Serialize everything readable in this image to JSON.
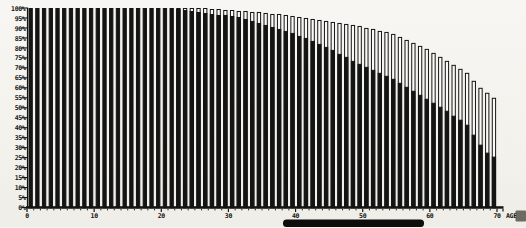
{
  "page": {
    "background": "#f3f1ec",
    "ink": "#141413",
    "paper_white": "#fbfaf6"
  },
  "chart_data": {
    "type": "bar",
    "title": "",
    "subtitle": "",
    "xlabel": "AGE",
    "ylabel": "",
    "xlim": [
      0,
      70
    ],
    "ylim": [
      0,
      100
    ],
    "grid": false,
    "legend_position": "none",
    "bar_unit": "one vertical bar per year of age, ages 1 through 70",
    "x_ticks": [
      0,
      10,
      20,
      30,
      40,
      50,
      60,
      70
    ],
    "y_tick_labels_top_to_bottom": [
      "100%",
      "95%",
      "90%",
      "85%",
      "80%",
      "75%",
      "70%",
      "65%",
      "60%",
      "55%",
      "50%",
      "45%",
      "40%",
      "35%",
      "30%",
      "25%",
      "20%",
      "15%",
      "10%",
      "5%",
      "0%"
    ],
    "ages": [
      1,
      2,
      3,
      4,
      5,
      6,
      7,
      8,
      9,
      10,
      11,
      12,
      13,
      14,
      15,
      16,
      17,
      18,
      19,
      20,
      21,
      22,
      23,
      24,
      25,
      26,
      27,
      28,
      29,
      30,
      31,
      32,
      33,
      34,
      35,
      36,
      37,
      38,
      39,
      40,
      41,
      42,
      43,
      44,
      45,
      46,
      47,
      48,
      49,
      50,
      51,
      52,
      53,
      54,
      55,
      56,
      57,
      58,
      59,
      60,
      61,
      62,
      63,
      64,
      65,
      66,
      67,
      68,
      69,
      70
    ],
    "series": [
      {
        "name": "hollow-outline-bar-top-percent",
        "style": "white bar with black outline (upper portion of each bar)",
        "values": [
          100,
          100,
          100,
          100,
          100,
          100,
          100,
          100,
          100,
          100,
          100,
          100,
          100,
          100,
          100,
          100,
          100,
          100,
          100,
          100,
          100,
          100,
          100,
          100,
          100,
          100,
          100,
          99.5,
          99.5,
          99,
          99,
          98.5,
          98.5,
          98,
          98,
          97.5,
          97,
          97,
          96.5,
          96,
          95.5,
          95,
          94.5,
          94,
          93.5,
          93,
          92.5,
          92,
          91.5,
          91,
          90,
          89.5,
          88.5,
          88,
          87,
          85.5,
          84,
          82.5,
          81,
          79.5,
          77.5,
          75.5,
          73.5,
          71.5,
          69.5,
          67.5,
          63.5,
          60,
          57.5,
          55
        ]
      },
      {
        "name": "solid-black-bar-top-percent",
        "style": "solid black filled bar (lower portion of each bar)",
        "values": [
          100,
          100,
          100,
          100,
          100,
          100,
          100,
          100,
          100,
          100,
          100,
          100,
          100,
          100,
          100,
          100,
          100,
          100,
          100,
          100,
          100,
          100,
          99.5,
          99,
          98.5,
          98,
          97.5,
          97,
          96.5,
          96.5,
          96,
          95.5,
          94.5,
          93.5,
          92.5,
          91.5,
          90.5,
          89.5,
          88.5,
          87.5,
          86,
          85,
          83.5,
          82,
          80.5,
          79,
          77,
          75.5,
          73.5,
          72,
          70.5,
          69,
          67.5,
          66,
          64.5,
          62.5,
          60.5,
          58.5,
          56.5,
          54.5,
          52.5,
          50.5,
          48.5,
          46,
          44,
          41.5,
          36.5,
          31.5,
          27.5,
          25.5
        ]
      }
    ]
  }
}
